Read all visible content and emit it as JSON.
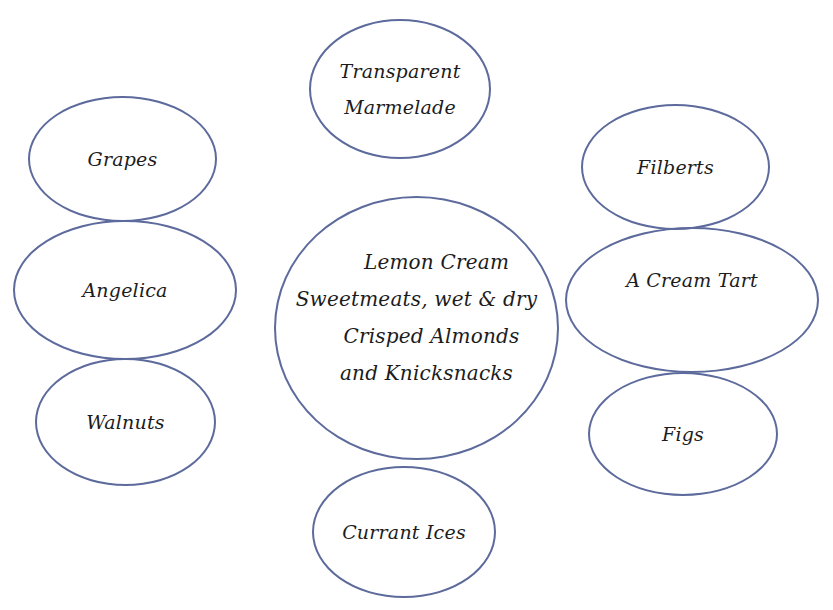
{
  "diagram": {
    "type": "table-setting-layout",
    "stroke_color": "#5d6a9c",
    "nodes": [
      {
        "id": "transparent-marmalade",
        "lines": [
          "Transparent",
          "Marmelade"
        ],
        "position": "top"
      },
      {
        "id": "grapes",
        "lines": [
          "Grapes"
        ],
        "position": "left-top"
      },
      {
        "id": "angelica",
        "lines": [
          "Angelica"
        ],
        "position": "left-middle"
      },
      {
        "id": "walnuts",
        "lines": [
          "Walnuts"
        ],
        "position": "left-bottom"
      },
      {
        "id": "center-dish",
        "lines": [
          "Lemon Cream",
          "Sweetmeats, wet & dry",
          "Crisped Almonds",
          "and Knicksnacks"
        ],
        "position": "center"
      },
      {
        "id": "filberts",
        "lines": [
          "Filberts"
        ],
        "position": "right-top"
      },
      {
        "id": "cream-tart",
        "lines": [
          "A Cream Tart"
        ],
        "position": "right-middle"
      },
      {
        "id": "figs",
        "lines": [
          "Figs"
        ],
        "position": "right-bottom"
      },
      {
        "id": "currant-ices",
        "lines": [
          "Currant Ices"
        ],
        "position": "bottom"
      }
    ]
  }
}
